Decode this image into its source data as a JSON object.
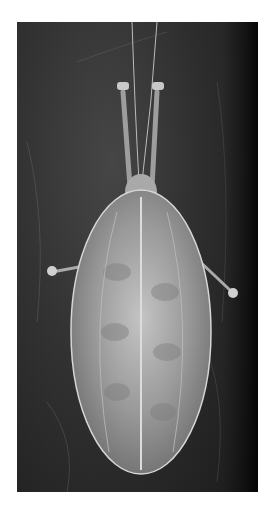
{
  "image": {
    "subject": "leaf-mimicking katydid on dark bark, dorsal view",
    "alt": "Grayscale photograph of a leaf-like katydid with long antennae, oval leaf-shaped wings with a central midrib, resting on dark tree bark",
    "palette": {
      "background": "#ffffff",
      "bark_dark": "#1e1e1e",
      "bark_mid": "#3a3a3a",
      "wing_light": "#bdbdbd",
      "wing_mid": "#8f8f8f",
      "vein": "#d8d8d8"
    }
  }
}
